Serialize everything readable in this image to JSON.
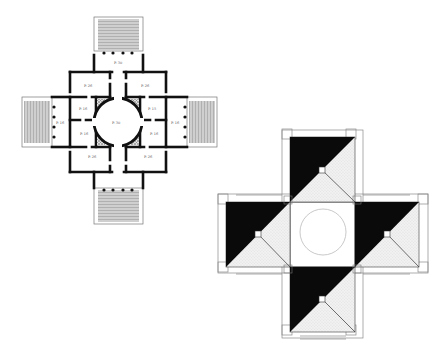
{
  "figure": {
    "colors": {
      "background": "#ffffff",
      "wall": "#111111",
      "line": "#6a6a6a",
      "stair_fill": "#bdbdbd",
      "hatch": "#d9d9d9",
      "solid": "#0a0a0a"
    }
  },
  "plan": {
    "labels": {
      "north_portico": "P. 30",
      "south_portico": "",
      "west_portico": "P. 16",
      "east_portico": "P. 16",
      "rotunda": "P. 30",
      "nw_room": "P. 26",
      "ne_room": "P. 26",
      "nw_small": "P. 16",
      "ne_small": "P. 15",
      "sw_small": "P. 16",
      "se_small": "P. 16",
      "sw_room": "P. 26",
      "se_room": "P. 26"
    }
  },
  "diagram": {
    "caption": ""
  }
}
